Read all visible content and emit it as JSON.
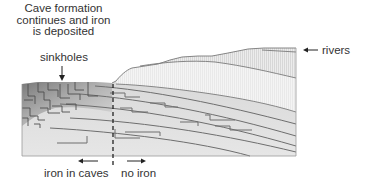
{
  "diagram": {
    "title_lines": [
      "Cave formation",
      "continues and iron",
      "is deposited"
    ],
    "labels": {
      "sinkholes": "sinkholes",
      "rivers": "rivers",
      "iron_in_caves": "iron in caves",
      "no_iron": "no iron"
    },
    "colors": {
      "text": "#333333",
      "strata_line": "#6b6b6b",
      "rock_fill": "#dcdcdc",
      "hill_fill": "#e6e6e6",
      "cave_zone_dark": "#8a8a8a",
      "arrow": "#222222"
    }
  }
}
